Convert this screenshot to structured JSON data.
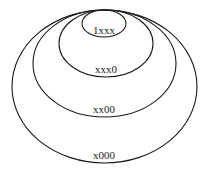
{
  "diagram": {
    "type": "nested-ellipses",
    "stroke_color": "#1a1a1a",
    "background": "#ffffff",
    "sets": [
      {
        "label": "x000",
        "cx": 104.5,
        "cy": 86.5,
        "rx": 92.5,
        "ry": 76.5,
        "label_x": 104,
        "label_y": 159
      },
      {
        "label": "xx00",
        "cx": 104.5,
        "cy": 63.5,
        "rx": 71.5,
        "ry": 53.5,
        "label_x": 104,
        "label_y": 113
      },
      {
        "label": "xxx0",
        "cx": 106,
        "cy": 43.5,
        "rx": 47,
        "ry": 33.5,
        "label_x": 106,
        "label_y": 73
      },
      {
        "label": "1xxx",
        "cx": 104,
        "cy": 23.5,
        "rx": 22,
        "ry": 13.5,
        "label_x": 104,
        "label_y": 34
      }
    ]
  }
}
